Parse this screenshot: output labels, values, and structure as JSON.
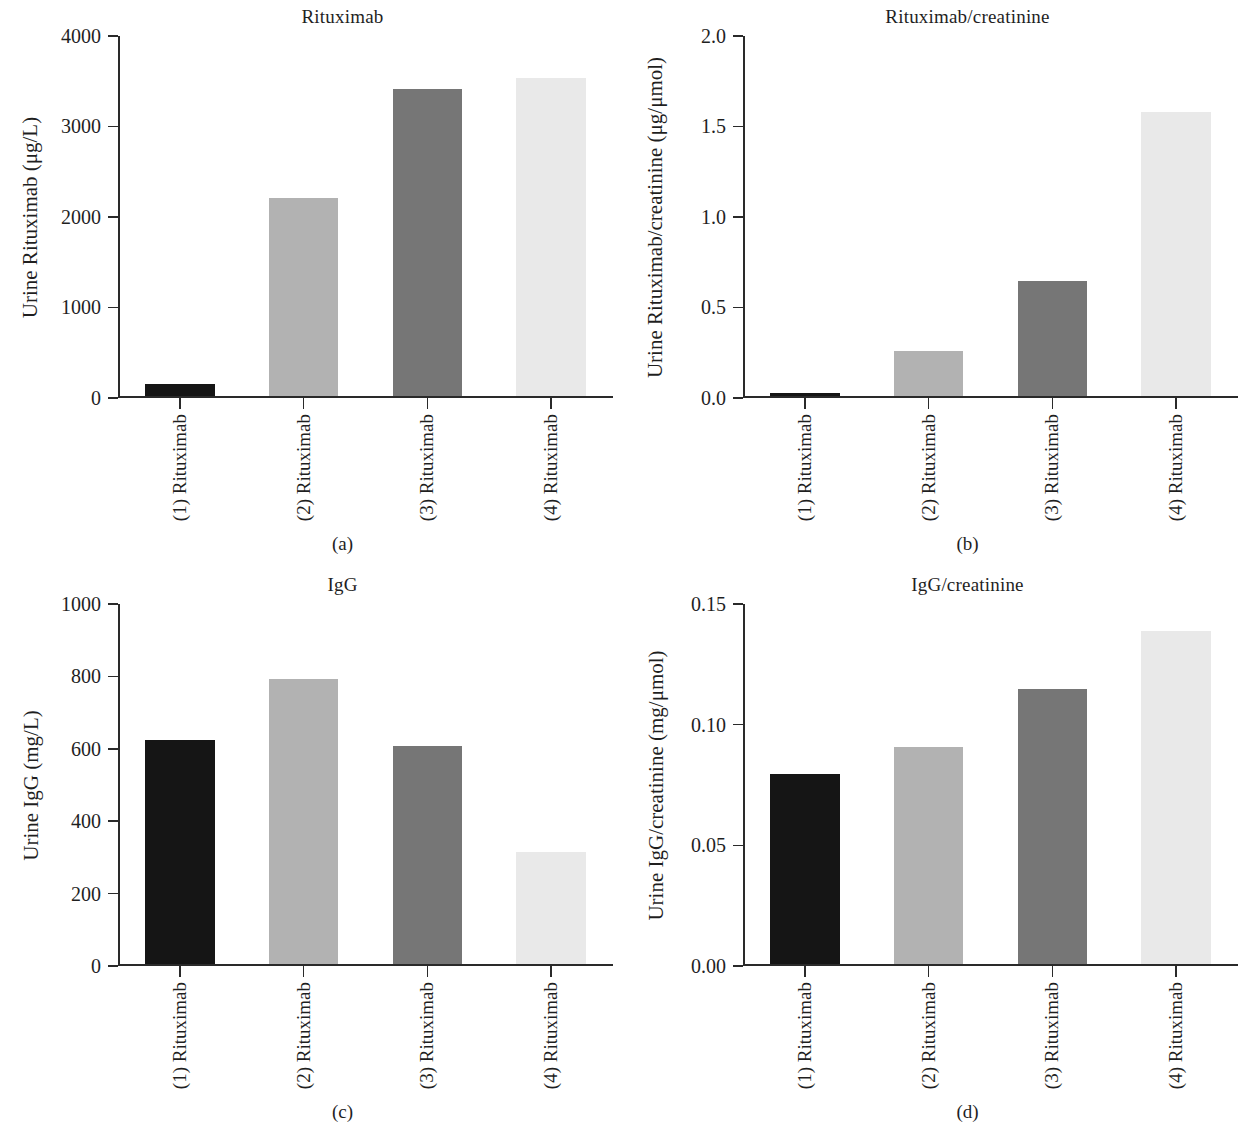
{
  "figure": {
    "background": "#ffffff",
    "bar_colors": [
      "#151515",
      "#b2b2b2",
      "#767676",
      "#e9e9e9"
    ],
    "categories": [
      "(1) Rituximab",
      "(2) Rituximab",
      "(3) Rituximab",
      "(4) Rituximab"
    ]
  },
  "panels": [
    {
      "id": "a",
      "caption": "(a)",
      "title": "Rituximab",
      "ylabel": "Urine Rituximab (μg/L)",
      "yticks": [
        "0",
        "1000",
        "2000",
        "3000",
        "4000"
      ]
    },
    {
      "id": "b",
      "caption": "(b)",
      "title": "Rituximab/creatinine",
      "ylabel": "Urine Rituximab/creatinine (μg/μmol)",
      "yticks": [
        "0.0",
        "0.5",
        "1.0",
        "1.5",
        "2.0"
      ]
    },
    {
      "id": "c",
      "caption": "(c)",
      "title": "IgG",
      "ylabel": "Urine IgG (mg/L)",
      "yticks": [
        "0",
        "200",
        "400",
        "600",
        "800",
        "1000"
      ]
    },
    {
      "id": "d",
      "caption": "(d)",
      "title": "IgG/creatinine",
      "ylabel": "Urine IgG/creatinine (mg/μmol)",
      "yticks": [
        "0.00",
        "0.05",
        "0.10",
        "0.15"
      ]
    }
  ],
  "chart_data": [
    {
      "type": "bar",
      "panel": "a",
      "title": "Rituximab",
      "xlabel": "",
      "ylabel": "Urine Rituximab (μg/L)",
      "categories": [
        "(1) Rituximab",
        "(2) Rituximab",
        "(3) Rituximab",
        "(4) Rituximab"
      ],
      "values": [
        140,
        2190,
        3400,
        3520
      ],
      "ylim": [
        0,
        4000
      ],
      "yticks": [
        0,
        1000,
        2000,
        3000,
        4000
      ],
      "grid": false,
      "legend": "none"
    },
    {
      "type": "bar",
      "panel": "b",
      "title": "Rituximab/creatinine",
      "xlabel": "",
      "ylabel": "Urine Rituximab/creatinine (μg/μmol)",
      "categories": [
        "(1) Rituximab",
        "(2) Rituximab",
        "(3) Rituximab",
        "(4) Rituximab"
      ],
      "values": [
        0.015,
        0.25,
        0.64,
        1.57
      ],
      "ylim": [
        0,
        2.0
      ],
      "yticks": [
        0.0,
        0.5,
        1.0,
        1.5,
        2.0
      ],
      "grid": false,
      "legend": "none"
    },
    {
      "type": "bar",
      "panel": "c",
      "title": "IgG",
      "xlabel": "",
      "ylabel": "Urine IgG (mg/L)",
      "categories": [
        "(1) Rituximab",
        "(2) Rituximab",
        "(3) Rituximab",
        "(4) Rituximab"
      ],
      "values": [
        620,
        788,
        602,
        311
      ],
      "ylim": [
        0,
        1000
      ],
      "yticks": [
        0,
        200,
        400,
        600,
        800,
        1000
      ],
      "grid": false,
      "legend": "none"
    },
    {
      "type": "bar",
      "panel": "d",
      "title": "IgG/creatinine",
      "xlabel": "",
      "ylabel": "Urine IgG/creatinine (mg/μmol)",
      "categories": [
        "(1) Rituximab",
        "(2) Rituximab",
        "(3) Rituximab",
        "(4) Rituximab"
      ],
      "values": [
        0.079,
        0.09,
        0.114,
        0.138
      ],
      "ylim": [
        0,
        0.15
      ],
      "yticks": [
        0.0,
        0.05,
        0.1,
        0.15
      ],
      "grid": false,
      "legend": "none"
    }
  ]
}
